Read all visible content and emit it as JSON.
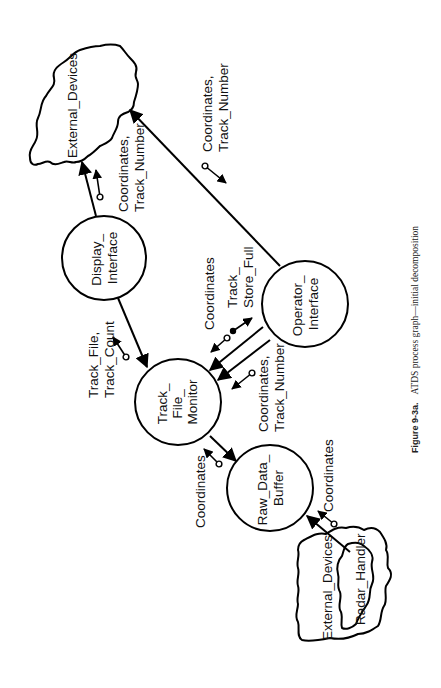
{
  "figure": {
    "caption_label": "Figure 9-3a.",
    "caption_text": "ATDS process graph—initial decomposition"
  },
  "nodes": {
    "external_devices_top": "External_Devices",
    "display_interface": [
      "Display_",
      "Interface"
    ],
    "operator_interface": [
      "Operator_",
      "Interface"
    ],
    "track_file_monitor": [
      "Track_",
      "File_",
      "Monitor"
    ],
    "raw_data_buffer": [
      "Raw_Data_",
      "Buffer"
    ],
    "external_devices_bottom": "External_Devices",
    "radar_handler": "Radar_Handler"
  },
  "flows": {
    "display_to_external": [
      "Coordinates,",
      "Track_Number"
    ],
    "operator_to_external": [
      "Coordinates,",
      "Track_Number"
    ],
    "monitor_to_display": [
      "Track_File,",
      "Track_Count"
    ],
    "monitor_to_operator_coords": "Coordinates",
    "operator_to_monitor_full": [
      "Track_",
      "Store_Full"
    ],
    "operator_to_monitor_coords": [
      "Coordinates,",
      "Track_Number"
    ],
    "buffer_to_monitor": "Coordinates",
    "radar_to_buffer": "Coordinates"
  },
  "colors": {
    "ink": "#000000",
    "background": "#ffffff"
  }
}
